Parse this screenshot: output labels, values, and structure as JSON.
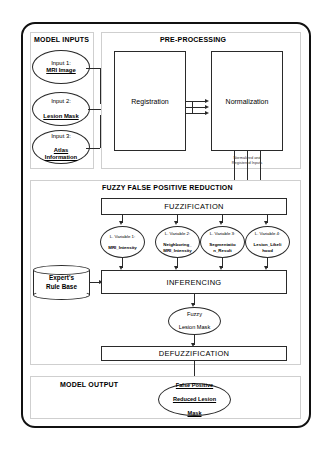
{
  "diagram": {
    "sections": {
      "model_inputs": "MODEL INPUTS",
      "pre_processing": "PRE-PROCESSING",
      "fuzzy_reduction": "FUZZY FALSE POSITIVE REDUCTION",
      "model_output": "MODEL OUTPUT"
    },
    "inputs": [
      {
        "prefix": "Input 1:",
        "name": "MRI Image"
      },
      {
        "prefix": "Input 2:",
        "name": "Lesion Mask"
      },
      {
        "prefix": "Input 3:",
        "name": "Atlas Information"
      }
    ],
    "preprocessing_steps": [
      {
        "label": "Registration"
      },
      {
        "label": "Normalization"
      }
    ],
    "edge_labels": {
      "normalized_registered": "Normalized and",
      "normalized_registered_2": "Registered Inputs"
    },
    "fuzzification": {
      "label": "FUZZIFICATION"
    },
    "linguistic_variables": [
      {
        "line1": "L. Variable 1:",
        "line2": "MRI_Intensity",
        "line3": ""
      },
      {
        "line1": "L. Variable 2:",
        "line2": "Neighboring_",
        "line3": "MRI_Intensity"
      },
      {
        "line1": "L. Variable 3:",
        "line2": "Segmentatio",
        "line3": "n_Result"
      },
      {
        "line1": "L. Variable 4:",
        "line2": "Lesion_Likeli",
        "line3": "hood"
      }
    ],
    "rule_base": {
      "line1": "Expert's",
      "line2": "Rule Base"
    },
    "inferencing": {
      "label": "INFERENCING"
    },
    "fuzzy_lesion_mask": {
      "line1": "Fuzzy",
      "line2": "Lesion Mask"
    },
    "defuzzification": {
      "label": "DEFUZZIFICATION"
    },
    "output": {
      "line1": "False Positive",
      "line2": "Reduced Lesion",
      "line3": "Mask"
    },
    "colors": {
      "frame": "#111111",
      "stroke": "#2a2a2a",
      "panel_border": "#cfcfcf",
      "background": "#ffffff"
    }
  }
}
